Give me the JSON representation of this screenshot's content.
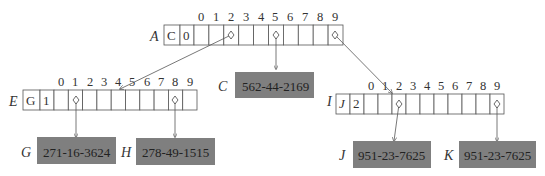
{
  "diagram": {
    "box_color": "#7f7f7f",
    "nodes": {
      "A": {
        "label": "A",
        "type_cell": "C",
        "count_cell": "0",
        "indices": [
          "0",
          "1",
          "2",
          "3",
          "4",
          "5",
          "6",
          "7",
          "8",
          "9"
        ]
      },
      "E": {
        "label": "E",
        "type_cell": "G",
        "count_cell": "1",
        "indices": [
          "0",
          "1",
          "2",
          "3",
          "4",
          "5",
          "6",
          "7",
          "8",
          "9"
        ]
      },
      "I": {
        "label": "I",
        "type_cell": "J",
        "count_cell": "2",
        "indices": [
          "0",
          "1",
          "2",
          "3",
          "4",
          "5",
          "6",
          "7",
          "8",
          "9"
        ]
      }
    },
    "records": {
      "C": {
        "label": "C",
        "value": "562-44-2169"
      },
      "G": {
        "label": "G",
        "value": "271-16-3624"
      },
      "H": {
        "label": "H",
        "value": "278-49-1515"
      },
      "J": {
        "label": "J",
        "value": "951-23-7625"
      },
      "K": {
        "label": "K",
        "value": "951-23-7625"
      }
    },
    "edges": [
      {
        "from": "A",
        "slot": "2",
        "to": "E"
      },
      {
        "from": "A",
        "slot": "5",
        "to": "C"
      },
      {
        "from": "A",
        "slot": "9",
        "to": "I"
      },
      {
        "from": "E",
        "slot": "1",
        "to": "G"
      },
      {
        "from": "E",
        "slot": "8",
        "to": "H"
      },
      {
        "from": "I",
        "slot": "2",
        "to": "J"
      },
      {
        "from": "I",
        "slot": "9",
        "to": "K"
      }
    ]
  }
}
